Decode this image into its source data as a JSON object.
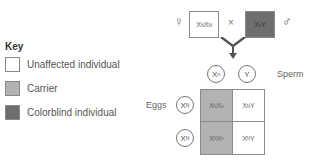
{
  "key": {
    "title": "Key",
    "items": [
      {
        "label": "Unaffected individual",
        "color": "#ffffff"
      },
      {
        "label": "Carrier",
        "color": "#b3b3b3"
      },
      {
        "label": "Colorblind individual",
        "color": "#6e6e6e"
      }
    ]
  },
  "cross": {
    "female_symbol": "♀",
    "male_symbol": "♂",
    "times": "×",
    "female": {
      "base1": "X",
      "sup1": "N",
      "base2": "X",
      "sup2": "N",
      "color": "#ffffff"
    },
    "male": {
      "base1": "X",
      "sup1": "n",
      "base2": "Y",
      "color": "#6e6e6e"
    }
  },
  "sperm": {
    "label": "Sperm",
    "gametes": [
      {
        "base": "X",
        "sup": "n"
      },
      {
        "base": "Y",
        "sup": ""
      }
    ]
  },
  "eggs": {
    "label": "Eggs",
    "gametes": [
      {
        "base": "X",
        "sup": "N"
      },
      {
        "base": "X",
        "sup": "N"
      }
    ]
  },
  "punnett": {
    "cells": [
      {
        "b1": "X",
        "s1": "N",
        "b2": "X",
        "s2": "n",
        "color": "#b3b3b3"
      },
      {
        "b1": "X",
        "s1": "N",
        "b2": "Y",
        "s2": "",
        "color": "#ffffff"
      },
      {
        "b1": "X",
        "s1": "N",
        "b2": "X",
        "s2": "n",
        "color": "#b3b3b3"
      },
      {
        "b1": "X",
        "s1": "N",
        "b2": "Y",
        "s2": "",
        "color": "#ffffff"
      }
    ]
  }
}
